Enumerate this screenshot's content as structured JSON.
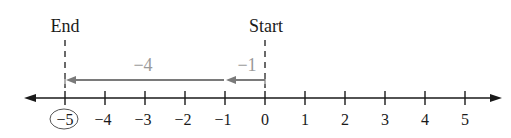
{
  "diagram": {
    "type": "number-line",
    "labels": {
      "end": "End",
      "start": "Start"
    },
    "ticks": [
      "−5",
      "−4",
      "−3",
      "−2",
      "−1",
      "0",
      "1",
      "2",
      "3",
      "4",
      "5"
    ],
    "tick_values": [
      -5,
      -4,
      -3,
      -2,
      -1,
      0,
      1,
      2,
      3,
      4,
      5
    ],
    "circled_value": "−5",
    "moves": [
      {
        "label": "−1",
        "from": 0,
        "to": -1
      },
      {
        "label": "−4",
        "from": -1,
        "to": -5
      }
    ],
    "colors": {
      "axis": "#1a1a1a",
      "move_arrow": "#7a7a7a",
      "move_label": "#9a9a9a",
      "circle": "#555555"
    }
  }
}
